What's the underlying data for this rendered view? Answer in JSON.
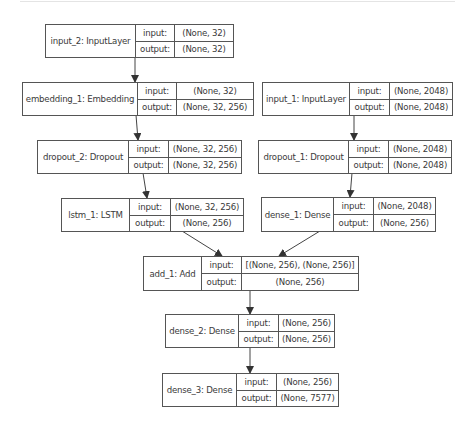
{
  "nodes": [
    {
      "id": "input_2",
      "name": "input_2: InputLayer",
      "input_label": "input:",
      "output_label": "output:",
      "input": "(None, 32)",
      "output": "(None, 32)"
    },
    {
      "id": "embedding_1",
      "name": "embedding_1: Embedding",
      "input_label": "input:",
      "output_label": "output:",
      "input": "(None, 32)",
      "output": "(None, 32, 256)"
    },
    {
      "id": "input_1",
      "name": "input_1: InputLayer",
      "input_label": "input:",
      "output_label": "output:",
      "input": "(None, 2048)",
      "output": "(None, 2048)"
    },
    {
      "id": "dropout_2",
      "name": "dropout_2: Dropout",
      "input_label": "input:",
      "output_label": "output:",
      "input": "(None, 32, 256)",
      "output": "(None, 32, 256)"
    },
    {
      "id": "dropout_1",
      "name": "dropout_1: Dropout",
      "input_label": "input:",
      "output_label": "output:",
      "input": "(None, 2048)",
      "output": "(None, 2048)"
    },
    {
      "id": "lstm_1",
      "name": "lstm_1: LSTM",
      "input_label": "input:",
      "output_label": "output:",
      "input": "(None, 32, 256)",
      "output": "(None, 256)"
    },
    {
      "id": "dense_1",
      "name": "dense_1: Dense",
      "input_label": "input:",
      "output_label": "output:",
      "input": "(None, 2048)",
      "output": "(None, 256)"
    },
    {
      "id": "add_1",
      "name": "add_1: Add",
      "input_label": "input:",
      "output_label": "output:",
      "input": "[(None, 256), (None, 256)]",
      "output": "(None, 256)"
    },
    {
      "id": "dense_2",
      "name": "dense_2: Dense",
      "input_label": "input:",
      "output_label": "output:",
      "input": "(None, 256)",
      "output": "(None, 256)"
    },
    {
      "id": "dense_3",
      "name": "dense_3: Dense",
      "input_label": "input:",
      "output_label": "output:",
      "input": "(None, 256)",
      "output": "(None, 7577)"
    }
  ],
  "edges": [
    {
      "from": "input_2",
      "to": "embedding_1"
    },
    {
      "from": "embedding_1",
      "to": "dropout_2"
    },
    {
      "from": "dropout_2",
      "to": "lstm_1"
    },
    {
      "from": "input_1",
      "to": "dropout_1"
    },
    {
      "from": "dropout_1",
      "to": "dense_1"
    },
    {
      "from": "lstm_1",
      "to": "add_1"
    },
    {
      "from": "dense_1",
      "to": "add_1"
    },
    {
      "from": "add_1",
      "to": "dense_2"
    },
    {
      "from": "dense_2",
      "to": "dense_3"
    }
  ]
}
